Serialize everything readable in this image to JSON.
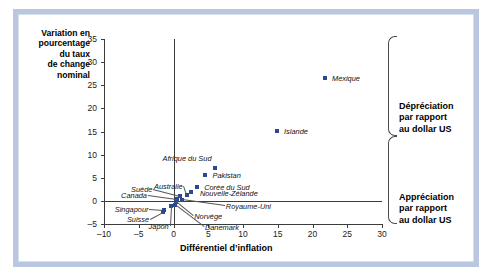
{
  "figure": {
    "frame_color": "#b9c7e0",
    "marker_color": "#2b4a8b"
  },
  "chart_data": {
    "type": "scatter",
    "title": "",
    "xlabel": "Différentiel d’inflation",
    "ylabel": "Variation en pourcentage du taux de change nominal",
    "ylabel_lines": [
      "Variation en",
      "pourcentage",
      "du taux",
      "de change",
      "nominal"
    ],
    "xlim": [
      -10,
      30
    ],
    "ylim": [
      -5,
      35
    ],
    "xticks": [
      -10,
      -5,
      0,
      5,
      10,
      15,
      20,
      25,
      30
    ],
    "xtick_labels": [
      "–10",
      "–5",
      "0",
      "5",
      "10",
      "15",
      "20",
      "25",
      "30"
    ],
    "yticks": [
      -5,
      0,
      5,
      10,
      15,
      20,
      25,
      30,
      35
    ],
    "ytick_labels": [
      "–5",
      "0",
      "5",
      "10",
      "15",
      "20",
      "25",
      "30",
      "35"
    ],
    "grid": false,
    "legend": "none",
    "points": [
      {
        "label": "Mexique",
        "x": 21.8,
        "y": 26.6
      },
      {
        "label": "Islande",
        "x": 14.9,
        "y": 15.2
      },
      {
        "label": "Afrique du Sud",
        "x": 5.9,
        "y": 7.2
      },
      {
        "label": "Pakistan",
        "x": 4.6,
        "y": 5.6
      },
      {
        "label": "Corée du Sud",
        "x": 3.4,
        "y": 3.1
      },
      {
        "label": "Nouvelle-Zélande",
        "x": 2.5,
        "y": 2.0
      },
      {
        "label": "Australie",
        "x": 1.9,
        "y": 1.3
      },
      {
        "label": "Suède",
        "x": 1.0,
        "y": 1.1
      },
      {
        "label": "Canada",
        "x": 0.5,
        "y": 0.5
      },
      {
        "label": "Royaume-Uni",
        "x": 1.2,
        "y": 0.1
      },
      {
        "label": "Norvège",
        "x": 0.4,
        "y": -0.3
      },
      {
        "label": "Danemark",
        "x": 0.2,
        "y": -0.9
      },
      {
        "label": "Japon",
        "x": -0.4,
        "y": -1.2
      },
      {
        "label": "Singapour",
        "x": -1.3,
        "y": -2.0
      },
      {
        "label": "Suisse",
        "x": -1.5,
        "y": -2.4
      }
    ],
    "annotations": [
      {
        "name": "depreciation",
        "lines": [
          "Dépréciation",
          "par rapport",
          "au dollar US"
        ]
      },
      {
        "name": "appreciation",
        "lines": [
          "Appréciation",
          "par rapport",
          "au dollar US"
        ]
      }
    ]
  },
  "labels": {
    "mexique": "Mexique",
    "islande": "Islande",
    "afrique_du_sud": "Afrique du Sud",
    "pakistan": "Pakistan",
    "coree_du_sud": "Corée du Sud",
    "nouvelle_zelande": "Nouvelle-Zélande",
    "australie": "Australie",
    "suede": "Suède",
    "canada": "Canada",
    "royaume_uni": "Royaume-Uni",
    "norvege": "Norvège",
    "danemark": "Danemark",
    "japon": "Japon",
    "singapour": "Singapour",
    "suisse": "Suisse"
  },
  "annotations": {
    "depreciation_l1": "Dépréciation",
    "depreciation_l2": "par rapport",
    "depreciation_l3": "au dollar US",
    "appreciation_l1": "Appréciation",
    "appreciation_l2": "par rapport",
    "appreciation_l3": "au dollar US"
  },
  "axis_titles": {
    "y_l1": "Variation en",
    "y_l2": "pourcentage",
    "y_l3": "du taux",
    "y_l4": "de change",
    "y_l5": "nominal",
    "x": "Différentiel d’inflation"
  }
}
